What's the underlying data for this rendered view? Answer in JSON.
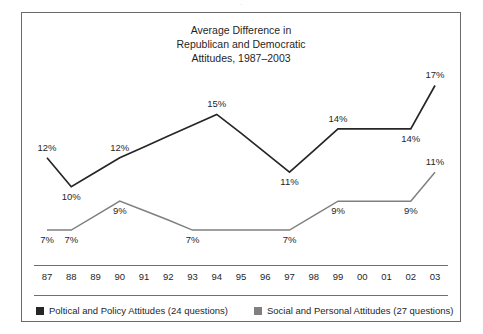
{
  "top_crop_text": "·",
  "title": {
    "line1": "Average Difference in",
    "line2": "Republican and Democratic",
    "line3": "Attitudes, 1987–2003"
  },
  "colors": {
    "political": "#262626",
    "social": "#808080",
    "frame": "#6a6a6a",
    "rule": "#6f6f6f",
    "text": "#1f1f1f",
    "background": "#ffffff"
  },
  "legend": {
    "political": {
      "label": "Poltical and Policy Attitudes (24 questions)",
      "swatch": "dark-square-swatch"
    },
    "social": {
      "label": "Social and Personal Attitudes (27 questions)",
      "swatch": "gray-square-swatch"
    }
  },
  "chart_data": {
    "type": "line",
    "title": "Average Difference in Republican and Democratic Attitudes, 1987–2003",
    "xlabel": "",
    "ylabel": "",
    "grid": false,
    "legend_position": "bottom",
    "ylim": [
      5,
      18
    ],
    "categories": [
      "87",
      "88",
      "89",
      "90",
      "91",
      "92",
      "93",
      "94",
      "95",
      "96",
      "97",
      "98",
      "99",
      "00",
      "01",
      "02",
      "03"
    ],
    "series": [
      {
        "name": "Poltical and Policy Attitudes (24 questions)",
        "color": "#262626",
        "values": [
          12,
          10,
          11,
          12,
          12.75,
          13.5,
          14.25,
          15,
          13.7,
          12.35,
          11,
          12.5,
          14,
          14,
          14,
          14,
          17
        ],
        "labeled_points": [
          {
            "category": "87",
            "value": 12,
            "text": "12%",
            "position": "above"
          },
          {
            "category": "88",
            "value": 10,
            "text": "10%",
            "position": "below"
          },
          {
            "category": "90",
            "value": 12,
            "text": "12%",
            "position": "above"
          },
          {
            "category": "94",
            "value": 15,
            "text": "15%",
            "position": "above"
          },
          {
            "category": "97",
            "value": 11,
            "text": "11%",
            "position": "below"
          },
          {
            "category": "99",
            "value": 14,
            "text": "14%",
            "position": "above"
          },
          {
            "category": "02",
            "value": 14,
            "text": "14%",
            "position": "below"
          },
          {
            "category": "03",
            "value": 17,
            "text": "17%",
            "position": "above"
          }
        ]
      },
      {
        "name": "Social and Personal Attitudes (27 questions)",
        "color": "#808080",
        "values": [
          7,
          7,
          8,
          9,
          8.35,
          7.7,
          7,
          7,
          7,
          7,
          7,
          8,
          9,
          9,
          9,
          9,
          11
        ],
        "labeled_points": [
          {
            "category": "87",
            "value": 7,
            "text": "7%",
            "position": "below"
          },
          {
            "category": "88",
            "value": 7,
            "text": "7%",
            "position": "below"
          },
          {
            "category": "90",
            "value": 9,
            "text": "9%",
            "position": "below"
          },
          {
            "category": "93",
            "value": 7,
            "text": "7%",
            "position": "below"
          },
          {
            "category": "97",
            "value": 7,
            "text": "7%",
            "position": "below"
          },
          {
            "category": "99",
            "value": 9,
            "text": "9%",
            "position": "below"
          },
          {
            "category": "02",
            "value": 9,
            "text": "9%",
            "position": "below"
          },
          {
            "category": "03",
            "value": 11,
            "text": "11%",
            "position": "above"
          }
        ]
      }
    ]
  }
}
